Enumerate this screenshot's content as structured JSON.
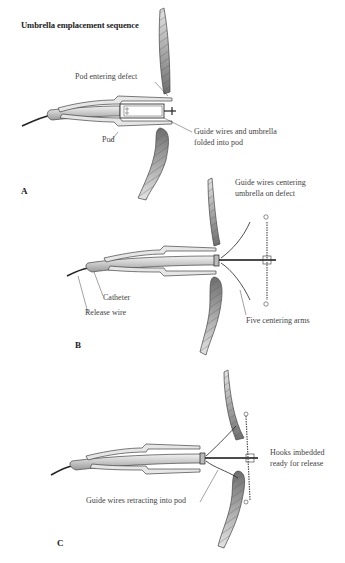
{
  "figure": {
    "title": "Umbrella emplacement sequence",
    "panels": [
      {
        "letter": "A",
        "labels": {
          "pod_entering": "Pod entering defect",
          "pod": "Pod",
          "guide_wires_1": "Guide wires and umbrella",
          "guide_wires_2": "folded into pod"
        }
      },
      {
        "letter": "B",
        "labels": {
          "centering_1": "Guide wires centering",
          "centering_2": "umbrella on defect",
          "catheter": "Catheter",
          "release_wire": "Release wire",
          "five_arms": "Five centering arms"
        }
      },
      {
        "letter": "C",
        "labels": {
          "hooks_1": "Hooks imbedded",
          "hooks_2": "ready for release",
          "retracting": "Guide wires retracting into pod"
        }
      }
    ]
  },
  "colors": {
    "tissue_dark": "#7a7a7a",
    "tissue_light": "#d6d6d6",
    "catheter": "#cfcfcf",
    "line": "#333333"
  }
}
